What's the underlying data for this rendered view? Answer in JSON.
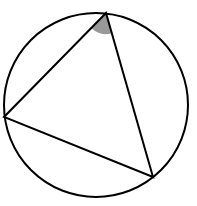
{
  "diagram": {
    "type": "inscribed-triangle",
    "circle": {
      "cx": 96,
      "cy": 105,
      "r": 92
    },
    "vertices": {
      "top": {
        "x": 106,
        "y": 13
      },
      "left": {
        "x": 4,
        "y": 117
      },
      "bottom_right": {
        "x": 153,
        "y": 177
      }
    },
    "shaded_angle": {
      "vertex": "top",
      "radius": 21,
      "color": "#999999"
    },
    "stroke_color": "#000000",
    "stroke_width": 2
  }
}
